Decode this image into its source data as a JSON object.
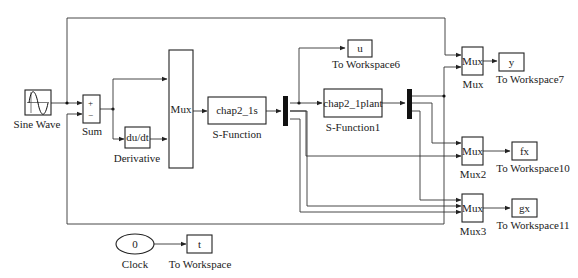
{
  "diagram": {
    "type": "Simulink block diagram",
    "blocks": {
      "sine_wave": {
        "label": "Sine Wave"
      },
      "sum": {
        "label": "Sum",
        "plus": "+",
        "minus": "−"
      },
      "derivative": {
        "label": "Derivative",
        "text": "du/dt"
      },
      "mux_main": {
        "text": "Mux"
      },
      "s_function": {
        "label": "S-Function",
        "text": "chap2_1s"
      },
      "s_function1": {
        "label": "S-Function1",
        "text": "chap2_1plant"
      },
      "to_workspace6": {
        "label": "To Workspace6",
        "text": "u"
      },
      "mux_y": {
        "label": "Mux",
        "text": "Mux"
      },
      "to_workspace7": {
        "label": "To Workspace7",
        "text": "y"
      },
      "mux2": {
        "label": "Mux2",
        "text": "Mux"
      },
      "to_workspace10": {
        "label": "To Workspace10",
        "text": "fx"
      },
      "mux3": {
        "label": "Mux3",
        "text": "Mux"
      },
      "to_workspace11": {
        "label": "To Workspace11",
        "text": "gx"
      },
      "clock": {
        "label": "Clock",
        "text": "0"
      },
      "to_workspace": {
        "label": "To Workspace",
        "text": "t"
      }
    }
  }
}
